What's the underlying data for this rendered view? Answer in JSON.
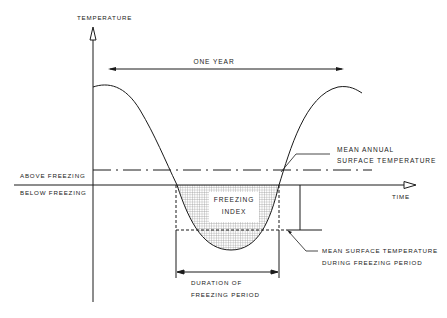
{
  "diagram": {
    "y_axis_label": "TEMPERATURE",
    "x_axis_label": "TIME",
    "period_label": "ONE YEAR",
    "zero_line_labels": {
      "above": "ABOVE FREEZING",
      "below": "BELOW FREEZING"
    },
    "mean_annual_label": {
      "line1": "MEAN ANNUAL",
      "line2": "SURFACE TEMPERATURE"
    },
    "freezing_index_label": {
      "line1": "FREEZING",
      "line2": "INDEX"
    },
    "mean_freezing_label": {
      "line1": "MEAN SURFACE TEMPERATURE",
      "line2": "DURING FREEZING PERIOD"
    },
    "duration_label": {
      "line1": "DURATION OF",
      "line2": "FREEZING PERIOD"
    },
    "colors": {
      "line": "#1a1a1a",
      "background": "#ffffff",
      "shading": "#9a9a9a"
    }
  }
}
